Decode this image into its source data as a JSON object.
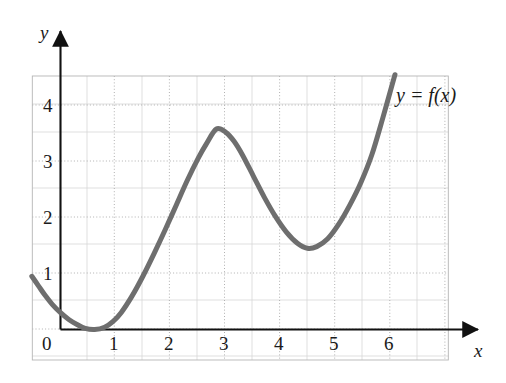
{
  "chart_data": {
    "type": "line",
    "title": "",
    "subtitle": "",
    "xlabel": "x",
    "ylabel": "y",
    "xlim": [
      -0.5,
      7.0
    ],
    "ylim": [
      -0.6,
      4.7
    ],
    "xticks": [
      "0",
      "1",
      "2",
      "3",
      "4",
      "5",
      "6"
    ],
    "xtick_values": [
      0,
      1,
      2,
      3,
      4,
      5,
      6
    ],
    "yticks": [
      "1",
      "2",
      "3",
      "4"
    ],
    "ytick_values": [
      1,
      2,
      3,
      4
    ],
    "grid": true,
    "grid_minor": true,
    "legend": "none",
    "annotations": [
      {
        "text": "y = f(x)",
        "x": 6.2,
        "y": 4.3
      }
    ],
    "series": [
      {
        "name": "f(x)",
        "color": "#6e6e6e",
        "linewidth": 5,
        "points": [
          {
            "x": -0.52,
            "y": 0.95
          },
          {
            "x": -0.4,
            "y": 0.78
          },
          {
            "x": -0.28,
            "y": 0.61
          },
          {
            "x": -0.15,
            "y": 0.45
          },
          {
            "x": 0.0,
            "y": 0.3
          },
          {
            "x": 0.15,
            "y": 0.18
          },
          {
            "x": 0.3,
            "y": 0.09
          },
          {
            "x": 0.45,
            "y": 0.02
          },
          {
            "x": 0.62,
            "y": 0.0
          },
          {
            "x": 0.8,
            "y": 0.04
          },
          {
            "x": 0.95,
            "y": 0.14
          },
          {
            "x": 1.1,
            "y": 0.3
          },
          {
            "x": 1.3,
            "y": 0.6
          },
          {
            "x": 1.5,
            "y": 0.96
          },
          {
            "x": 1.7,
            "y": 1.36
          },
          {
            "x": 1.9,
            "y": 1.78
          },
          {
            "x": 2.1,
            "y": 2.22
          },
          {
            "x": 2.3,
            "y": 2.66
          },
          {
            "x": 2.5,
            "y": 3.06
          },
          {
            "x": 2.65,
            "y": 3.32
          },
          {
            "x": 2.83,
            "y": 3.58
          },
          {
            "x": 3.0,
            "y": 3.52
          },
          {
            "x": 3.15,
            "y": 3.36
          },
          {
            "x": 3.3,
            "y": 3.12
          },
          {
            "x": 3.5,
            "y": 2.74
          },
          {
            "x": 3.7,
            "y": 2.36
          },
          {
            "x": 3.9,
            "y": 2.02
          },
          {
            "x": 4.1,
            "y": 1.74
          },
          {
            "x": 4.3,
            "y": 1.54
          },
          {
            "x": 4.48,
            "y": 1.45
          },
          {
            "x": 4.65,
            "y": 1.48
          },
          {
            "x": 4.85,
            "y": 1.62
          },
          {
            "x": 5.05,
            "y": 1.88
          },
          {
            "x": 5.25,
            "y": 2.22
          },
          {
            "x": 5.45,
            "y": 2.62
          },
          {
            "x": 5.65,
            "y": 3.12
          },
          {
            "x": 5.85,
            "y": 3.78
          },
          {
            "x": 6.07,
            "y": 4.55
          }
        ],
        "key_points": [
          {
            "label": "start",
            "x": -0.5,
            "y": 0.95
          },
          {
            "label": "local-minimum",
            "x": 0.6,
            "y": 0.0
          },
          {
            "label": "local-maximum",
            "x": 2.83,
            "y": 3.6
          },
          {
            "label": "local-minimum",
            "x": 4.46,
            "y": 1.45
          },
          {
            "label": "end",
            "x": 6.07,
            "y": 4.55
          }
        ]
      }
    ]
  },
  "axes": {
    "y_axis_label": "y",
    "x_axis_label": "x"
  }
}
